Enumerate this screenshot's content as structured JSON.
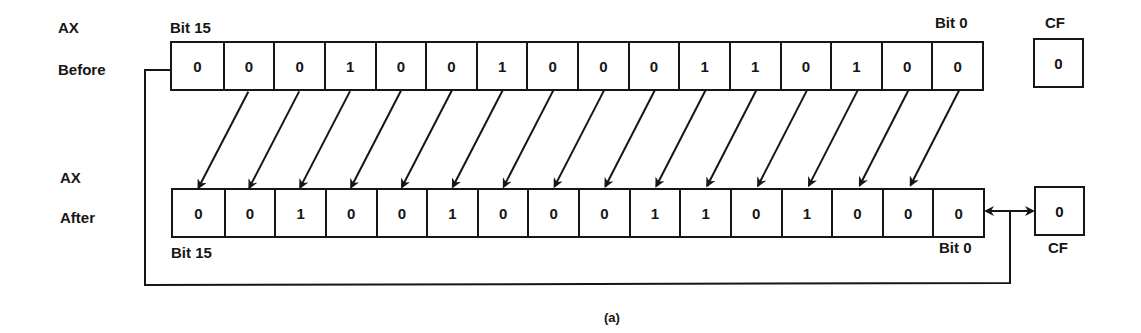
{
  "figure": {
    "caption": "(a)",
    "operation": "rotate left by 1 (ROL AX,1)"
  },
  "before": {
    "register_label": "AX",
    "state_label": "Before",
    "msb_label": "Bit 15",
    "lsb_label": "Bit 0",
    "bits": [
      "0",
      "0",
      "0",
      "1",
      "0",
      "0",
      "1",
      "0",
      "0",
      "0",
      "1",
      "1",
      "0",
      "1",
      "0",
      "0"
    ],
    "cf_label": "CF",
    "cf_value": "0"
  },
  "after": {
    "register_label": "AX",
    "state_label": "After",
    "msb_label": "Bit 15",
    "lsb_label": "Bit 0",
    "bits": [
      "0",
      "0",
      "1",
      "0",
      "0",
      "1",
      "0",
      "0",
      "0",
      "1",
      "1",
      "0",
      "1",
      "0",
      "0",
      "0"
    ],
    "cf_label": "CF",
    "cf_value": "0"
  },
  "colors": {
    "ink": "#161616",
    "background": "#ffffff"
  }
}
